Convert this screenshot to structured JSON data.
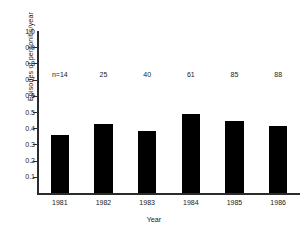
{
  "chart_data": {
    "type": "bar",
    "title": "",
    "xlabel": "Year",
    "ylabel": "Episodes of peritonitis/year",
    "categories": [
      "1981",
      "1982",
      "1983",
      "1984",
      "1985",
      "1986"
    ],
    "values": [
      0.36,
      0.425,
      0.385,
      0.49,
      0.445,
      0.415
    ],
    "ylim": [
      0.0,
      1.0
    ],
    "xlim": [
      0,
      6
    ],
    "ytick_labels": [
      "1.0",
      "0.9",
      "0.8",
      "0.7",
      "0.6",
      "0.5",
      "0.4",
      "0.3",
      "0.2",
      "0.1"
    ],
    "ytick_values": [
      1.0,
      0.9,
      0.8,
      0.7,
      0.6,
      0.5,
      0.4,
      0.3,
      0.2,
      0.1
    ],
    "grid": false,
    "legend": false,
    "legend_position": "none",
    "bar_color": "#000000",
    "axis_color": "#2b2b2b",
    "background_color": "#ffffff",
    "annotations": [
      {
        "label": "n=14",
        "category": "1981",
        "y": 0.73
      },
      {
        "label": "25",
        "category": "1982",
        "y": 0.73
      },
      {
        "label": "40",
        "category": "1983",
        "y": 0.73
      },
      {
        "label": "61",
        "category": "1984",
        "y": 0.73
      },
      {
        "label": "85",
        "category": "1985",
        "y": 0.73
      },
      {
        "label": "88",
        "category": "1986",
        "y": 0.73
      }
    ]
  }
}
